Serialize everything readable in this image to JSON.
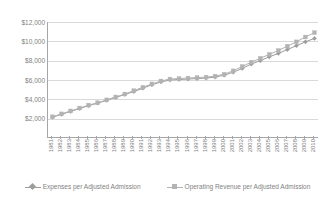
{
  "chart_data": {
    "type": "line",
    "title": "",
    "xlabel": "",
    "ylabel": "",
    "ylim": [
      0,
      12000
    ],
    "ytick_values": [
      2000,
      4000,
      6000,
      8000,
      10000,
      12000
    ],
    "ytick_labels": [
      "$2,000",
      "$4,000",
      "$6,000",
      "$8,000",
      "$10,000",
      "$12,000"
    ],
    "grid": true,
    "legend_position": "bottom",
    "categories": [
      "1981",
      "1982",
      "1983",
      "1984",
      "1985",
      "1986",
      "1987",
      "1988",
      "1989",
      "1990",
      "1991",
      "1992",
      "1993",
      "1994",
      "1995",
      "1996",
      "1997",
      "1998",
      "1999",
      "2000",
      "2001",
      "2002",
      "2003",
      "2004",
      "2005",
      "2006",
      "2007",
      "2008",
      "2009",
      "2010"
    ],
    "series": [
      {
        "name": "Expenses per Adjusted Admission",
        "marker": "diamond",
        "color": "#9c9c9c",
        "values": [
          2150,
          2450,
          2750,
          3050,
          3350,
          3600,
          3900,
          4200,
          4500,
          4800,
          5150,
          5500,
          5800,
          6000,
          6050,
          6100,
          6150,
          6200,
          6300,
          6500,
          6800,
          7200,
          7650,
          8000,
          8400,
          8750,
          9150,
          9550,
          9950,
          10300
        ]
      },
      {
        "name": "Operating Revenue per Adjusted Admission",
        "marker": "square",
        "color": "#b3b3b3",
        "values": [
          2200,
          2500,
          2800,
          3100,
          3400,
          3650,
          3950,
          4250,
          4550,
          4900,
          5250,
          5600,
          5900,
          6100,
          6150,
          6200,
          6250,
          6300,
          6400,
          6600,
          6950,
          7400,
          7850,
          8250,
          8650,
          9050,
          9500,
          9950,
          10450,
          10900
        ]
      }
    ]
  },
  "legend": {
    "items": [
      {
        "label": "Expenses per Adjusted Admission"
      },
      {
        "label": "Operating Revenue per Adjusted Admission"
      }
    ]
  }
}
